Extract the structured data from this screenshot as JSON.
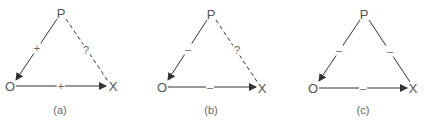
{
  "colors": {
    "line": "#333333",
    "text": "#555555"
  },
  "panels": [
    {
      "caption": "(a)",
      "nodes": {
        "p": "P",
        "o": "O",
        "x": "X"
      },
      "edges": {
        "p_o": {
          "label": "+",
          "style": "solid",
          "arrow": "to-O"
        },
        "p_x": {
          "label": "?",
          "style": "dashed",
          "arrow": "none"
        },
        "o_x": {
          "label": "+",
          "style": "solid",
          "arrow": "to-X"
        }
      }
    },
    {
      "caption": "(b)",
      "nodes": {
        "p": "P",
        "o": "O",
        "x": "X"
      },
      "edges": {
        "p_o": {
          "label": "–",
          "style": "solid",
          "arrow": "to-O"
        },
        "p_x": {
          "label": "?",
          "style": "dashed",
          "arrow": "none"
        },
        "o_x": {
          "label": "–",
          "style": "solid",
          "arrow": "to-X"
        }
      }
    },
    {
      "caption": "(c)",
      "nodes": {
        "p": "P",
        "o": "O",
        "x": "X"
      },
      "edges": {
        "p_o": {
          "label": "–",
          "style": "solid",
          "arrow": "to-O"
        },
        "p_x": {
          "label": "–",
          "style": "solid",
          "arrow": "none"
        },
        "o_x": {
          "label": "–",
          "style": "solid",
          "arrow": "to-X"
        }
      }
    }
  ]
}
